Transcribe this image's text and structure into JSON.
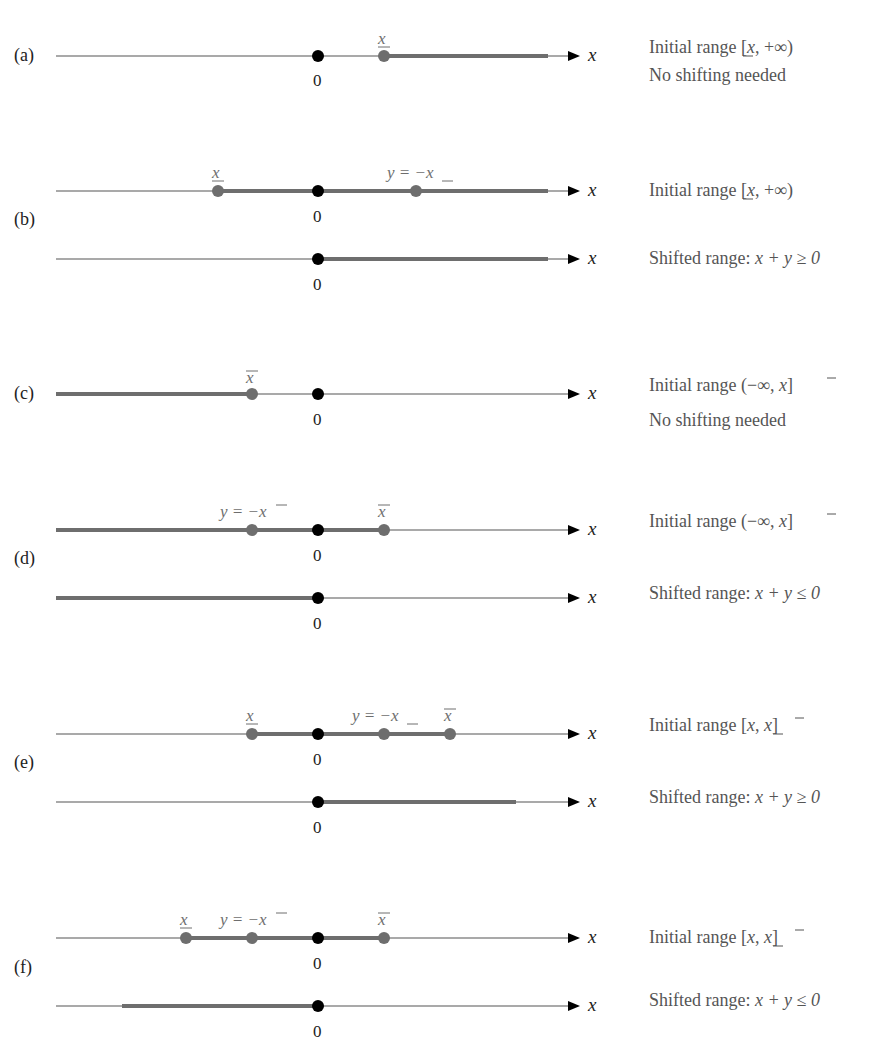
{
  "colors": {
    "axis": "#555555",
    "range": "#6e6e6e",
    "point": "#6e6e6e",
    "zero_point": "#000000",
    "text": "#555555"
  },
  "axis_variable": "x",
  "zero_label": "0",
  "panels": [
    {
      "id": "a",
      "label": "(a)",
      "lines": [
        {
          "role": "initial",
          "range": {
            "from": "x_lower",
            "to": "+inf"
          },
          "points": [
            {
              "name": "zero",
              "label": "0"
            },
            {
              "name": "x_lower",
              "label": "x̲"
            }
          ],
          "description": "Initial range [x̲, +∞)"
        }
      ],
      "note": "No shifting needed"
    },
    {
      "id": "b",
      "label": "(b)",
      "lines": [
        {
          "role": "initial",
          "range": {
            "from": "x_lower",
            "to": "+inf"
          },
          "points": [
            {
              "name": "x_lower",
              "label": "x̲"
            },
            {
              "name": "zero",
              "label": "0"
            },
            {
              "name": "y_neg_x_lower",
              "label": "y = −x̲"
            }
          ],
          "description": "Initial range [x̲, +∞)"
        },
        {
          "role": "shifted",
          "range": {
            "from": "0",
            "to": "+inf"
          },
          "points": [
            {
              "name": "zero",
              "label": "0"
            }
          ],
          "description": "Shifted range: x + y ≥ 0"
        }
      ]
    },
    {
      "id": "c",
      "label": "(c)",
      "lines": [
        {
          "role": "initial",
          "range": {
            "from": "-inf",
            "to": "x_upper"
          },
          "points": [
            {
              "name": "x_upper",
              "label": "x̄"
            },
            {
              "name": "zero",
              "label": "0"
            }
          ],
          "description": "Initial range (−∞, x̄]"
        }
      ],
      "note": "No shifting needed"
    },
    {
      "id": "d",
      "label": "(d)",
      "lines": [
        {
          "role": "initial",
          "range": {
            "from": "-inf",
            "to": "x_upper"
          },
          "points": [
            {
              "name": "y_neg_x_upper",
              "label": "y = −x̄"
            },
            {
              "name": "zero",
              "label": "0"
            },
            {
              "name": "x_upper",
              "label": "x̄"
            }
          ],
          "description": "Initial range (−∞, x̄]"
        },
        {
          "role": "shifted",
          "range": {
            "from": "-inf",
            "to": "0"
          },
          "points": [
            {
              "name": "zero",
              "label": "0"
            }
          ],
          "description": "Shifted range: x + y ≤ 0"
        }
      ]
    },
    {
      "id": "e",
      "label": "(e)",
      "lines": [
        {
          "role": "initial",
          "range": {
            "from": "x_lower",
            "to": "x_upper"
          },
          "points": [
            {
              "name": "x_lower",
              "label": "x̲"
            },
            {
              "name": "zero",
              "label": "0"
            },
            {
              "name": "y_neg_x_lower",
              "label": "y = −x̲"
            },
            {
              "name": "x_upper",
              "label": "x̄"
            }
          ],
          "description": "Initial range [x̲, x̄]"
        },
        {
          "role": "shifted",
          "range": {
            "from": "0",
            "to": "x_upper - x_lower"
          },
          "points": [
            {
              "name": "zero",
              "label": "0"
            }
          ],
          "description": "Shifted range: x + y ≥ 0"
        }
      ]
    },
    {
      "id": "f",
      "label": "(f)",
      "lines": [
        {
          "role": "initial",
          "range": {
            "from": "x_lower",
            "to": "x_upper"
          },
          "points": [
            {
              "name": "x_lower",
              "label": "x̲"
            },
            {
              "name": "y_neg_x_upper",
              "label": "y = −x̄"
            },
            {
              "name": "zero",
              "label": "0"
            },
            {
              "name": "x_upper",
              "label": "x̄"
            }
          ],
          "description": "Initial range [x̲, x̄]"
        },
        {
          "role": "shifted",
          "range": {
            "from": "x_lower - x_upper",
            "to": "0"
          },
          "points": [
            {
              "name": "zero",
              "label": "0"
            }
          ],
          "description": "Shifted range: x + y ≤ 0"
        }
      ]
    }
  ],
  "text": {
    "a_desc": "Initial range [",
    "a_desc_tail": ", +∞)",
    "b_desc": "Initial range [",
    "b_desc_tail": ", +∞)",
    "b_shift": "Shifted range: ",
    "b_shift_math": "x + y ≥ 0",
    "c_desc": "Initial range (−∞, ",
    "c_desc_tail": "]",
    "d_desc": "Initial range (−∞, ",
    "d_desc_tail": "]",
    "d_shift": "Shifted range: ",
    "d_shift_math": "x + y ≤ 0",
    "e_desc": "Initial range [",
    "e_desc_mid": ", ",
    "e_desc_tail": "]",
    "e_shift": "Shifted range: ",
    "e_shift_math": "x + y ≥ 0",
    "f_desc": "Initial range [",
    "f_desc_mid": ", ",
    "f_desc_tail": "]",
    "f_shift": "Shifted range: ",
    "f_shift_math": "x + y ≤ 0",
    "no_shift": "No shifting needed",
    "x": "x",
    "x_under": "x",
    "x_over": "x",
    "y_eq_neg": "y = −",
    "zero": "0",
    "label_a": "(a)",
    "label_b": "(b)",
    "label_c": "(c)",
    "label_d": "(d)",
    "label_e": "(e)",
    "label_f": "(f)"
  }
}
